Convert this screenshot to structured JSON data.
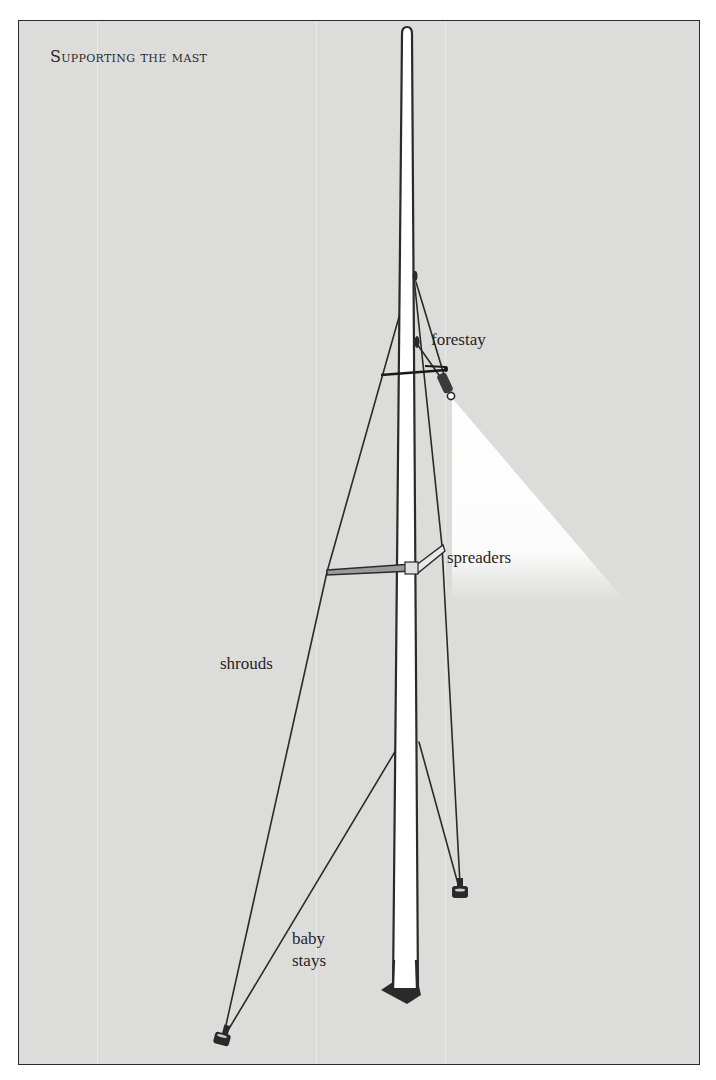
{
  "figure": {
    "title": "Supporting the mast",
    "labels": {
      "forestay": "forestay",
      "spreaders": "spreaders",
      "shrouds": "shrouds",
      "baby_stays_line1": "baby",
      "baby_stays_line2": "stays"
    },
    "components": [
      "mast",
      "forestay",
      "spreaders",
      "shrouds",
      "baby stays",
      "chainplates",
      "mast step"
    ],
    "colors": {
      "background": "#dcdcdb",
      "line": "#2a2a2a",
      "mast_fill": "#ffffff"
    }
  }
}
